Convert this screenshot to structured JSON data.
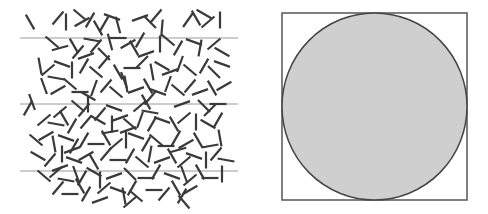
{
  "figure": {
    "width": 488,
    "height": 214,
    "background": "#ffffff"
  },
  "buffon_panel": {
    "description": "Buffon's needle: randomly dropped needles over parallel lines",
    "line_color": "#9a9a9a",
    "line_width": 1,
    "lines": [
      {
        "x1": 20,
        "x2": 238,
        "y": 38
      },
      {
        "x1": 20,
        "x2": 238,
        "y": 104
      },
      {
        "x1": 20,
        "x2": 238,
        "y": 171
      }
    ],
    "needle_color": "#3a3a3a",
    "needle_width": 2.2,
    "needle_length": 17,
    "needles": [
      [
        30,
        22,
        60
      ],
      [
        58,
        18,
        -50
      ],
      [
        66,
        22,
        90
      ],
      [
        80,
        15,
        40
      ],
      [
        82,
        22,
        -30
      ],
      [
        90,
        20,
        120
      ],
      [
        104,
        24,
        -60
      ],
      [
        112,
        17,
        20
      ],
      [
        118,
        25,
        75
      ],
      [
        140,
        18,
        -20
      ],
      [
        150,
        22,
        45
      ],
      [
        156,
        16,
        130
      ],
      [
        188,
        20,
        -55
      ],
      [
        196,
        18,
        60
      ],
      [
        204,
        14,
        30
      ],
      [
        208,
        22,
        -40
      ],
      [
        220,
        20,
        90
      ],
      [
        162,
        28,
        95
      ],
      [
        98,
        28,
        60
      ],
      [
        52,
        42,
        40
      ],
      [
        60,
        48,
        -15
      ],
      [
        74,
        46,
        60
      ],
      [
        78,
        52,
        130
      ],
      [
        92,
        40,
        10
      ],
      [
        96,
        46,
        -50
      ],
      [
        110,
        42,
        75
      ],
      [
        118,
        38,
        0
      ],
      [
        128,
        44,
        -30
      ],
      [
        134,
        48,
        60
      ],
      [
        140,
        40,
        120
      ],
      [
        160,
        44,
        90
      ],
      [
        168,
        40,
        40
      ],
      [
        178,
        48,
        -60
      ],
      [
        194,
        42,
        20
      ],
      [
        200,
        48,
        100
      ],
      [
        214,
        44,
        -40
      ],
      [
        222,
        52,
        30
      ],
      [
        86,
        56,
        160
      ],
      [
        104,
        54,
        45
      ],
      [
        146,
        54,
        -20
      ],
      [
        40,
        66,
        80
      ],
      [
        48,
        70,
        -40
      ],
      [
        62,
        64,
        20
      ],
      [
        72,
        70,
        90
      ],
      [
        84,
        66,
        -60
      ],
      [
        96,
        72,
        40
      ],
      [
        104,
        62,
        130
      ],
      [
        118,
        72,
        60
      ],
      [
        132,
        68,
        0
      ],
      [
        142,
        62,
        -45
      ],
      [
        152,
        72,
        80
      ],
      [
        162,
        66,
        30
      ],
      [
        170,
        72,
        -20
      ],
      [
        180,
        64,
        110
      ],
      [
        190,
        70,
        40
      ],
      [
        204,
        66,
        -60
      ],
      [
        214,
        72,
        45
      ],
      [
        222,
        64,
        20
      ],
      [
        56,
        78,
        10
      ],
      [
        124,
        80,
        70
      ],
      [
        44,
        86,
        70
      ],
      [
        58,
        90,
        -30
      ],
      [
        70,
        84,
        40
      ],
      [
        80,
        92,
        0
      ],
      [
        94,
        88,
        110
      ],
      [
        106,
        86,
        -50
      ],
      [
        116,
        92,
        40
      ],
      [
        126,
        84,
        80
      ],
      [
        136,
        90,
        -20
      ],
      [
        148,
        86,
        60
      ],
      [
        158,
        92,
        20
      ],
      [
        168,
        84,
        -70
      ],
      [
        178,
        90,
        40
      ],
      [
        190,
        86,
        130
      ],
      [
        200,
        92,
        -20
      ],
      [
        212,
        88,
        60
      ],
      [
        224,
        86,
        -30
      ],
      [
        88,
        96,
        30
      ],
      [
        150,
        98,
        -50
      ],
      [
        32,
        102,
        70
      ],
      [
        28,
        108,
        -60
      ],
      [
        78,
        106,
        40
      ],
      [
        84,
        110,
        -50
      ],
      [
        88,
        104,
        90
      ],
      [
        114,
        108,
        20
      ],
      [
        140,
        106,
        -40
      ],
      [
        146,
        102,
        60
      ],
      [
        150,
        112,
        10
      ],
      [
        182,
        104,
        -20
      ],
      [
        204,
        106,
        45
      ],
      [
        210,
        110,
        -45
      ],
      [
        218,
        104,
        0
      ],
      [
        60,
        112,
        -40
      ],
      [
        100,
        114,
        130
      ],
      [
        44,
        120,
        -40
      ],
      [
        56,
        124,
        10
      ],
      [
        64,
        118,
        60
      ],
      [
        72,
        126,
        120
      ],
      [
        86,
        122,
        -50
      ],
      [
        98,
        120,
        30
      ],
      [
        112,
        124,
        90
      ],
      [
        120,
        118,
        -20
      ],
      [
        130,
        124,
        40
      ],
      [
        140,
        120,
        110
      ],
      [
        152,
        124,
        -60
      ],
      [
        162,
        120,
        20
      ],
      [
        174,
        124,
        60
      ],
      [
        184,
        118,
        -40
      ],
      [
        196,
        122,
        90
      ],
      [
        208,
        124,
        30
      ],
      [
        218,
        120,
        -60
      ],
      [
        128,
        130,
        -20
      ],
      [
        36,
        140,
        40
      ],
      [
        46,
        136,
        -30
      ],
      [
        54,
        144,
        80
      ],
      [
        66,
        138,
        20
      ],
      [
        74,
        146,
        -60
      ],
      [
        84,
        140,
        120
      ],
      [
        96,
        144,
        0
      ],
      [
        106,
        138,
        60
      ],
      [
        116,
        144,
        -40
      ],
      [
        126,
        140,
        90
      ],
      [
        136,
        136,
        20
      ],
      [
        146,
        144,
        -60
      ],
      [
        156,
        140,
        40
      ],
      [
        166,
        146,
        0
      ],
      [
        176,
        138,
        120
      ],
      [
        186,
        144,
        -30
      ],
      [
        198,
        140,
        60
      ],
      [
        210,
        146,
        -10
      ],
      [
        220,
        138,
        80
      ],
      [
        110,
        132,
        -10
      ],
      [
        38,
        156,
        30
      ],
      [
        50,
        160,
        -50
      ],
      [
        62,
        154,
        90
      ],
      [
        74,
        160,
        20
      ],
      [
        86,
        156,
        -30
      ],
      [
        94,
        162,
        60
      ],
      [
        106,
        154,
        130
      ],
      [
        118,
        160,
        0
      ],
      [
        130,
        156,
        -60
      ],
      [
        142,
        162,
        40
      ],
      [
        150,
        154,
        100
      ],
      [
        162,
        160,
        -20
      ],
      [
        172,
        156,
        60
      ],
      [
        184,
        162,
        -40
      ],
      [
        194,
        156,
        20
      ],
      [
        206,
        160,
        90
      ],
      [
        216,
        154,
        -50
      ],
      [
        226,
        160,
        10
      ],
      [
        72,
        150,
        160
      ],
      [
        178,
        150,
        -15
      ],
      [
        44,
        176,
        40
      ],
      [
        56,
        172,
        -40
      ],
      [
        66,
        180,
        10
      ],
      [
        76,
        174,
        70
      ],
      [
        82,
        178,
        -60
      ],
      [
        94,
        172,
        30
      ],
      [
        100,
        180,
        90
      ],
      [
        114,
        176,
        -20
      ],
      [
        130,
        174,
        45
      ],
      [
        146,
        178,
        0
      ],
      [
        156,
        172,
        -60
      ],
      [
        172,
        176,
        20
      ],
      [
        184,
        174,
        70
      ],
      [
        190,
        180,
        -40
      ],
      [
        200,
        172,
        60
      ],
      [
        210,
        178,
        0
      ],
      [
        222,
        174,
        90
      ],
      [
        60,
        168,
        -20
      ],
      [
        58,
        188,
        -50
      ],
      [
        70,
        194,
        0
      ],
      [
        80,
        186,
        60
      ],
      [
        86,
        194,
        120
      ],
      [
        104,
        188,
        -40
      ],
      [
        118,
        190,
        20
      ],
      [
        124,
        196,
        80
      ],
      [
        132,
        188,
        -60
      ],
      [
        136,
        196,
        40
      ],
      [
        154,
        190,
        0
      ],
      [
        164,
        194,
        -50
      ],
      [
        176,
        188,
        60
      ],
      [
        182,
        196,
        120
      ],
      [
        190,
        190,
        -30
      ],
      [
        130,
        202,
        -40
      ],
      [
        184,
        202,
        50
      ],
      [
        100,
        200,
        -20
      ]
    ]
  },
  "circle_panel": {
    "description": "Circle inscribed in a square (Monte Carlo estimate of pi)",
    "square": {
      "x": 282,
      "y": 13,
      "width": 185,
      "height": 187,
      "stroke": "#555555",
      "stroke_width": 1.5,
      "fill": "#ffffff"
    },
    "circle": {
      "cx": 374.5,
      "cy": 106.5,
      "rx": 92.5,
      "ry": 93.5,
      "stroke": "#444444",
      "stroke_width": 1.5,
      "fill": "#cfcfcf"
    }
  }
}
